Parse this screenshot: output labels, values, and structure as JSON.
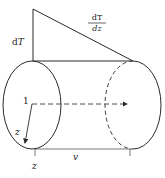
{
  "diagram": {
    "labels": {
      "dT": "dT",
      "gradient_numerator": "dT",
      "gradient_denominator": "dz",
      "point": "1",
      "radial_axis": "z",
      "axial_axis": "z",
      "velocity": "v"
    },
    "colors": {
      "stroke": "#2a2a2a",
      "dashed": "#3a3a3a",
      "background": "#ffffff"
    }
  }
}
